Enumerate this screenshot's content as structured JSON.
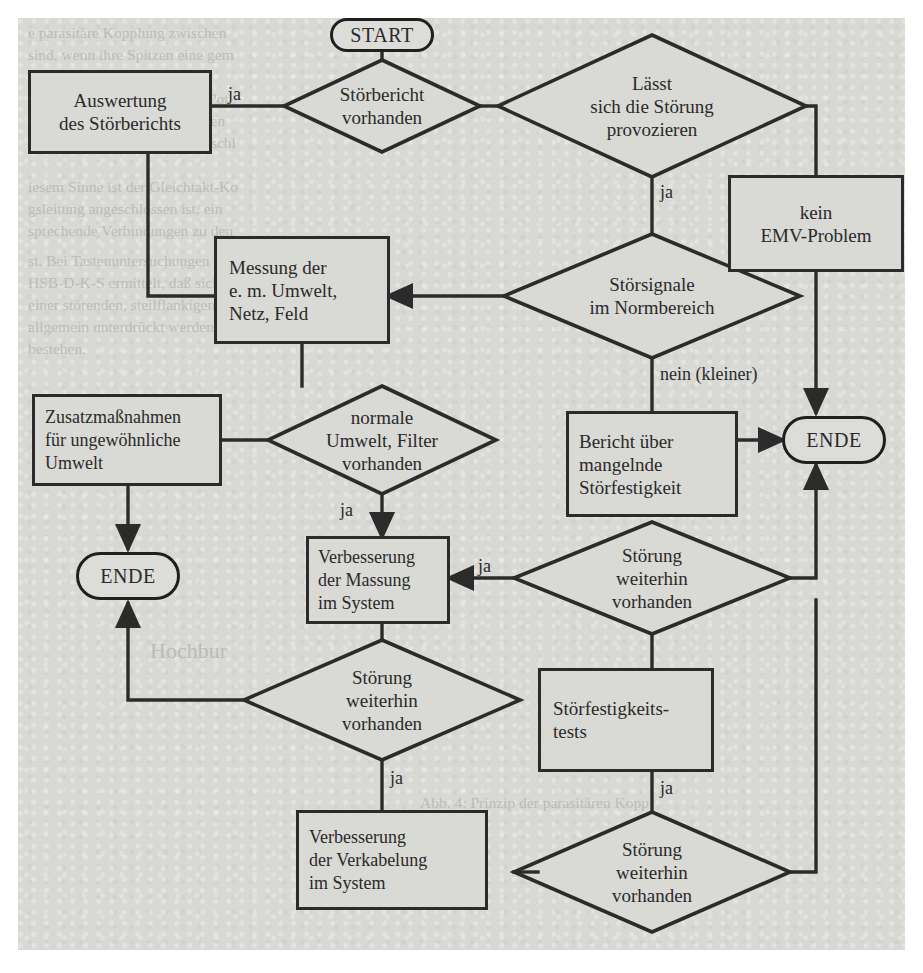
{
  "diagram": {
    "type": "flowchart",
    "language": "de",
    "nodes": [
      {
        "id": "start",
        "shape": "terminator",
        "label": "START"
      },
      {
        "id": "stoerbericht",
        "shape": "decision",
        "label": "Störbericht\nvorhanden",
        "line1": "Störbericht",
        "line2": "vorhanden"
      },
      {
        "id": "auswertung",
        "shape": "process",
        "label": "Auswertung\ndes Störberichts",
        "line1": "Auswertung",
        "line2": "des Störberichts"
      },
      {
        "id": "provozieren",
        "shape": "decision",
        "label": "Lässt\nsich die Störung\nprovozieren",
        "line1": "Lässt",
        "line2": "sich die Störung",
        "line3": "provozieren"
      },
      {
        "id": "keinemv",
        "shape": "process",
        "label": "kein\nEMV-Problem",
        "line1": "kein",
        "line2": "EMV-Problem"
      },
      {
        "id": "normbereich",
        "shape": "decision",
        "label": "Störsignale\nim Normbereich",
        "line1": "Störsignale",
        "line2": "im Normbereich"
      },
      {
        "id": "messung",
        "shape": "process",
        "label": "Messung der\ne. m. Umwelt,\nNetz, Feld",
        "line1": "Messung der",
        "line2": "e. m. Umwelt,",
        "line3": "Netz, Feld"
      },
      {
        "id": "berichtmangel",
        "shape": "process",
        "label": "Bericht über\nmangelnde\nStörfestigkeit",
        "line1": "Bericht über",
        "line2": "mangelnde",
        "line3": "Störfestigkeit"
      },
      {
        "id": "ende_right",
        "shape": "terminator",
        "label": "ENDE"
      },
      {
        "id": "filter",
        "shape": "decision",
        "label": "normale\nUmwelt, Filter\nvorhanden",
        "line1": "normale",
        "line2": "Umwelt, Filter",
        "line3": "vorhanden"
      },
      {
        "id": "zusatz",
        "shape": "process",
        "label": "Zusatzmaßnahmen\nfür ungewöhnliche\nUmwelt",
        "line1": "Zusatzmaßnahmen",
        "line2": "für ungewöhnliche",
        "line3": "Umwelt"
      },
      {
        "id": "ende_left",
        "shape": "terminator",
        "label": "ENDE"
      },
      {
        "id": "massung",
        "shape": "process",
        "label": "Verbesserung\nder Massung\nim System",
        "line1": "Verbesserung",
        "line2": "der Massung",
        "line3": "im System"
      },
      {
        "id": "weiter1",
        "shape": "decision",
        "label": "Störung\nweiterhin\nvorhanden",
        "line1": "Störung",
        "line2": "weiterhin",
        "line3": "vorhanden"
      },
      {
        "id": "weiter2",
        "shape": "decision",
        "label": "Störung\nweiterhin\nvorhanden",
        "line1": "Störung",
        "line2": "weiterhin",
        "line3": "vorhanden"
      },
      {
        "id": "tests",
        "shape": "process",
        "label": "Störfestigkeits-\ntests",
        "line1": "Störfestigkeits-",
        "line2": "tests"
      },
      {
        "id": "verkabelung",
        "shape": "process",
        "label": "Verbesserung\nder Verkabelung\nim System",
        "line1": "Verbesserung",
        "line2": "der Verkabelung",
        "line3": "im System"
      },
      {
        "id": "weiter3",
        "shape": "decision",
        "label": "Störung\nweiterhin\nvorhanden",
        "line1": "Störung",
        "line2": "weiterhin",
        "line3": "vorhanden"
      }
    ],
    "edge_labels": {
      "stoerbericht_ja": "ja",
      "provozieren_ja": "ja",
      "normbereich_nein": "nein (kleiner)",
      "filter_ja": "ja",
      "weiter1_ja": "ja",
      "weiter2_ja": "ja",
      "tests_ja": "ja",
      "weiter3_ja": "ja"
    },
    "colors": {
      "paper": "#d8d8d4",
      "ink": "#2b2b2b",
      "node_fill": "#d9d9d5",
      "page_background": "#ffffff"
    },
    "bleed_through_text": [
      "e parasitäre Kopplung zwischen",
      "sind, wenn ihre Spitzen eine gem",
      "Spannungsabfall entlang der",
      "wirkt. Die unterschiedlichen Pot",
      "urzschluß. Hier müssen Massen",
      "ohnen, natürlich mit ihren Anschl",
      "iesem Sinne ist der Gleichtakt-Ko",
      "gsleitung angeschlossen ist, ein",
      "sprechende Verbindungen zu den",
      "st. Bei Tastenuntersuchungen am PC",
      "HSB-D-K-S ermittelt, daß sich eine",
      "einer störenden, steilflankigen Flan",
      "allgemein unterdrückt werden kann.",
      "bestehen.",
      "Abb. 4: Prinzip der parasitären Kopp"
    ]
  }
}
